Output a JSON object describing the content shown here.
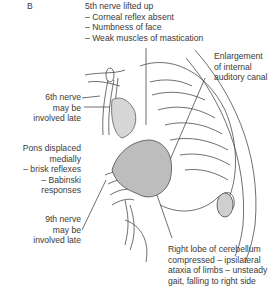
{
  "panel_label": "B",
  "labels": {
    "fifth_nerve": {
      "title": "5th nerve lifted up",
      "items": [
        "– Corneal reflex absent",
        "– Numbness of face",
        "– Weak muscles of mastication"
      ]
    },
    "auditory_canal": {
      "lines": [
        "Enlargement",
        "of internal",
        "auditory canal"
      ]
    },
    "sixth_nerve": {
      "lines": [
        "6th nerve",
        "may be",
        "involved late"
      ]
    },
    "pons": {
      "lines": [
        "Pons displaced",
        "medially",
        "– brisk reflexes",
        "– Babinski",
        "responses"
      ]
    },
    "ninth_nerve": {
      "lines": [
        "9th nerve",
        "may be",
        "involved late"
      ]
    },
    "cerebellum": {
      "lines": [
        "Right lobe of cerebellum",
        "compressed – ipsilateral",
        "ataxia of limbs – unsteady",
        "gait, falling to right side"
      ]
    }
  },
  "colors": {
    "text": "#3a3a3a",
    "line": "#4a4a4a",
    "tumour_fill": "#bdbdbd",
    "nerve_fill": "#d6d6d6"
  }
}
